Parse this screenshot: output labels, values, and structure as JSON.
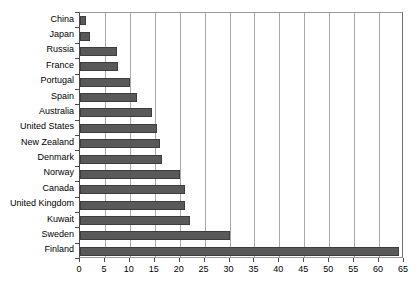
{
  "chart_data": {
    "type": "bar",
    "orientation": "horizontal",
    "title": "",
    "subtitle": "",
    "xlabel": "",
    "ylabel": "",
    "xlim": [
      0,
      65
    ],
    "grid": true,
    "legend": null,
    "xticks": [
      0,
      5,
      10,
      15,
      20,
      25,
      30,
      35,
      40,
      45,
      50,
      55,
      60,
      65
    ],
    "xtick_labels": [
      "0",
      "5",
      "10",
      "15",
      "20",
      "25",
      "30",
      "35",
      "40",
      "45",
      "50",
      "55",
      "60",
      "65"
    ],
    "bar_color": "#595959",
    "bar_edge_color": "#3d3d3d",
    "grid_color": "#a8a8a8",
    "categories": [
      "China",
      "Japan",
      "Russia",
      "France",
      "Portugal",
      "Spain",
      "Australia",
      "United States",
      "New Zealand",
      "Denmark",
      "Norway",
      "Canada",
      "United Kingdom",
      "Kuwait",
      "Sweden",
      "Finland"
    ],
    "values": [
      1.2,
      2.0,
      7.5,
      7.7,
      10.0,
      11.5,
      14.5,
      15.5,
      16.0,
      16.5,
      20.0,
      21.0,
      21.0,
      22.0,
      30.0,
      64.0
    ]
  }
}
